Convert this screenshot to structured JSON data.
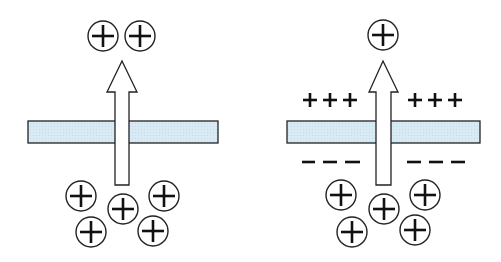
{
  "colors": {
    "membrane_fill": "#d6e9f2",
    "stroke": "#222222",
    "background": "#ffffff"
  },
  "panels": [
    {
      "name": "uncharged-membrane",
      "ions_above": 2,
      "ions_below": 5,
      "surface_charge_above": "",
      "surface_charge_below": ""
    },
    {
      "name": "charged-membrane",
      "ions_above": 1,
      "ions_below": 5,
      "surface_charge_above": "+++",
      "surface_charge_below": "– – –"
    }
  ],
  "labels": {
    "ion_symbol": "+",
    "pos_left_top": "+++",
    "pos_right_top": "+++",
    "neg_left_bottom": "– – –",
    "neg_right_bottom": "– – –"
  }
}
